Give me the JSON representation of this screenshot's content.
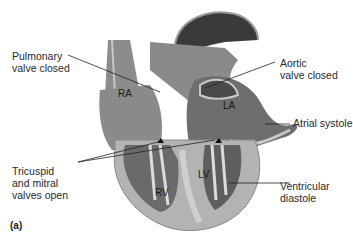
{
  "figure": {
    "panel_label": "(a)",
    "chambers": {
      "ra": "RA",
      "la": "LA",
      "rv": "RV",
      "lv": "LV"
    },
    "labels": {
      "pulmonary": [
        "Pulmonary",
        "valve closed"
      ],
      "aortic": [
        "Aortic",
        "valve closed"
      ],
      "atrial": [
        "Atrial systole"
      ],
      "tricuspid": [
        "Tricuspid",
        "and mitral",
        "valves open"
      ],
      "ventricular": [
        "Ventricular",
        "diastole"
      ]
    },
    "colors": {
      "dark": "#3a3a3a",
      "mid": "#7a7a7a",
      "light": "#b5b5b5",
      "pale": "#d9d9d9",
      "line": "#222222"
    }
  }
}
